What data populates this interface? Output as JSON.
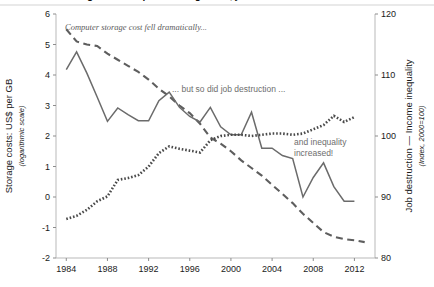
{
  "figure": {
    "title_cropped": "Cost of data storage and computer storage cost, job destruction",
    "background_color": "#ffffff",
    "width": 434,
    "height": 287
  },
  "annotations": [
    {
      "name": "annotation-storage-cost",
      "text": "Computer storage cost fell dramatically...",
      "style": "italic",
      "color": "#5b5b5b",
      "x": 65,
      "y": 30
    },
    {
      "name": "annotation-job-destruction",
      "text": "... but so did job destruction ...",
      "style": "plain",
      "color": "#6e6e6e",
      "x": 172,
      "y": 92
    },
    {
      "name": "annotation-inequality-line1",
      "text": "and inequality",
      "style": "plain",
      "color": "#5b5b5b",
      "x": 294,
      "y": 145
    },
    {
      "name": "annotation-inequality-line2",
      "text": "increased!",
      "style": "plain",
      "color": "#5b5b5b",
      "x": 294,
      "y": 156
    }
  ],
  "chart_data": {
    "type": "line",
    "xlabel": "",
    "xlim": [
      1983,
      2014
    ],
    "xticks": [
      1984,
      1988,
      1992,
      1996,
      2000,
      2004,
      2008,
      2012
    ],
    "grid": false,
    "legend_position": "none",
    "left_axis": {
      "label": "Storage costs: US$ per GB",
      "sublabel": "(logarithmic scale)",
      "ylim": [
        -2,
        6
      ],
      "yticks": [
        -2,
        -1,
        0,
        1,
        2,
        3,
        4,
        5,
        6
      ]
    },
    "right_axis": {
      "label": "Job destruction — Income inequality",
      "sublabel": "(Index, 2000=100)",
      "ylim": [
        80,
        120
      ],
      "yticks": [
        80,
        90,
        100,
        110,
        120
      ]
    },
    "series": [
      {
        "name": "Storage costs: US$ per GB (logarithmic scale)",
        "axis": "left",
        "style": "dashed",
        "color": "#5e5e5e",
        "x": [
          1984,
          1985,
          1986,
          1987,
          1988,
          1989,
          1990,
          1991,
          1992,
          1993,
          1994,
          1995,
          1996,
          1997,
          1998,
          1999,
          2000,
          2001,
          2002,
          2003,
          2004,
          2005,
          2006,
          2007,
          2008,
          2009,
          2010,
          2011,
          2012,
          2013
        ],
        "y": [
          5.5,
          5.1,
          5.0,
          4.95,
          4.7,
          4.5,
          4.3,
          4.1,
          3.85,
          3.55,
          3.3,
          3.0,
          2.75,
          2.4,
          1.95,
          1.75,
          1.5,
          1.2,
          0.95,
          0.7,
          0.4,
          0.1,
          -0.2,
          -0.55,
          -0.85,
          -1.15,
          -1.3,
          -1.38,
          -1.42,
          -1.48
        ]
      },
      {
        "name": "Job destruction (Index, 2000=100)",
        "axis": "right",
        "style": "solid",
        "color": "#6b6b6b",
        "x": [
          1984,
          1985,
          1986,
          1987,
          1988,
          1989,
          1990,
          1991,
          1992,
          1993,
          1994,
          1995,
          1996,
          1997,
          1998,
          1999,
          2000,
          2001,
          2002,
          2003,
          2004,
          2005,
          2006,
          2007,
          2008,
          2009,
          2010,
          2011,
          2012
        ],
        "y": [
          110.9,
          113.8,
          110.3,
          106.4,
          102.4,
          104.6,
          103.5,
          102.5,
          102.5,
          105.8,
          107.2,
          104.7,
          103.2,
          102.3,
          104.7,
          101.5,
          100.2,
          100.2,
          103.9,
          98.0,
          98.0,
          96.8,
          96.3,
          90.0,
          93.2,
          95.6,
          91.7,
          89.3,
          89.3
        ]
      },
      {
        "name": "Income inequality (Index, 2000=100)",
        "axis": "right",
        "style": "dotted",
        "color": "#4a4a4a",
        "x": [
          1984,
          1985,
          1986,
          1987,
          1988,
          1989,
          1990,
          1991,
          1992,
          1993,
          1994,
          1995,
          1996,
          1997,
          1998,
          1999,
          2000,
          2001,
          2002,
          2003,
          2004,
          2005,
          2006,
          2007,
          2008,
          2009,
          2010,
          2011,
          2012
        ],
        "y": [
          86.4,
          86.9,
          87.9,
          89.3,
          90.1,
          92.8,
          93.1,
          93.6,
          95.0,
          97.2,
          98.3,
          97.9,
          97.6,
          97.3,
          99.3,
          100.0,
          100.2,
          100.2,
          100.0,
          100.2,
          100.4,
          100.4,
          100.2,
          100.4,
          101.1,
          101.8,
          103.3,
          102.3,
          103.1
        ]
      }
    ]
  }
}
